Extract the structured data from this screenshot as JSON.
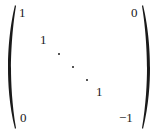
{
  "matrix": {
    "delimiter": "parentheses",
    "entries": {
      "top_left": "1",
      "top_right": "0",
      "row2_diag": "1",
      "row4_diag": "1",
      "bottom_left": "0",
      "bottom_right": "−1"
    },
    "diagonal_ellipsis": "⋱"
  }
}
